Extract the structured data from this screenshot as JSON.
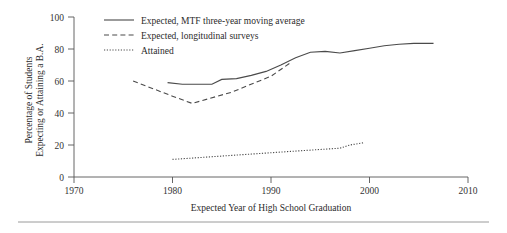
{
  "chart_data": {
    "type": "line",
    "title": "",
    "xlabel": "Expected Year of High School Graduation",
    "ylabel_line1": "Percentage of Students",
    "ylabel_line2": "Expecting or Attaining a B.A.",
    "xlim": [
      1970,
      2010
    ],
    "ylim": [
      0,
      100
    ],
    "xticks": [
      1970,
      1980,
      1990,
      2000,
      2010
    ],
    "yticks": [
      0,
      20,
      40,
      60,
      80,
      100
    ],
    "grid": false,
    "legend_position": "top-left-inside",
    "series": [
      {
        "name": "Expected, MTF three-year moving average",
        "style": "solid",
        "points": [
          [
            1979.5,
            59.0
          ],
          [
            1981.0,
            58.0
          ],
          [
            1982.5,
            58.0
          ],
          [
            1984.0,
            58.0
          ],
          [
            1985.0,
            61.0
          ],
          [
            1986.5,
            61.5
          ],
          [
            1988.0,
            63.5
          ],
          [
            1989.5,
            66.0
          ],
          [
            1991.0,
            70.0
          ],
          [
            1992.5,
            74.5
          ],
          [
            1994.0,
            78.0
          ],
          [
            1995.5,
            78.5
          ],
          [
            1997.0,
            77.5
          ],
          [
            1998.5,
            79.0
          ],
          [
            2000.0,
            80.5
          ],
          [
            2001.5,
            82.0
          ],
          [
            2003.0,
            83.0
          ],
          [
            2004.5,
            83.5
          ],
          [
            2006.5,
            83.5
          ]
        ]
      },
      {
        "name": "Expected, longitudinal surveys",
        "style": "dashed",
        "points": [
          [
            1976.0,
            60.0
          ],
          [
            1980.0,
            50.5
          ],
          [
            1982.0,
            46.0
          ],
          [
            1986.0,
            53.0
          ],
          [
            1990.0,
            63.0
          ],
          [
            1992.0,
            71.5
          ]
        ]
      },
      {
        "name": "Attained",
        "style": "dotted",
        "points": [
          [
            1980.0,
            11.0
          ],
          [
            1986.0,
            13.5
          ],
          [
            1992.0,
            16.0
          ],
          [
            1997.0,
            18.0
          ],
          [
            1998.0,
            20.0
          ],
          [
            1999.5,
            21.5
          ]
        ]
      }
    ],
    "legend_entries": [
      {
        "label": "Expected, MTF three-year moving average",
        "style": "solid"
      },
      {
        "label": "Expected, longitudinal surveys",
        "style": "dashed"
      },
      {
        "label": "Attained",
        "style": "dotted"
      }
    ]
  }
}
